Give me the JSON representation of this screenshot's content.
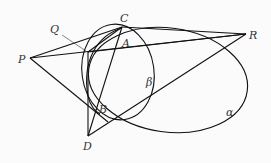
{
  "figure": {
    "type": "geometry-diagram",
    "points": [
      {
        "id": "P",
        "label": "P",
        "x": 30,
        "y": 58
      },
      {
        "id": "Q",
        "label": "Q",
        "x": 88,
        "y": 52
      },
      {
        "id": "C",
        "label": "C",
        "x": 122,
        "y": 26
      },
      {
        "id": "A",
        "label": "A",
        "x": 120,
        "y": 38
      },
      {
        "id": "R",
        "label": "R",
        "x": 246,
        "y": 34
      },
      {
        "id": "B",
        "label": "B",
        "x": 97,
        "y": 109
      },
      {
        "id": "D",
        "label": "D",
        "x": 88,
        "y": 136
      }
    ],
    "labels": {
      "P": "P",
      "Q": "Q",
      "C": "C",
      "A": "A",
      "R": "R",
      "B": "B",
      "D": "D",
      "alpha": "α",
      "beta": "β"
    },
    "curves": [
      {
        "name": "alpha",
        "label": "α",
        "kind": "ellipse"
      },
      {
        "name": "beta",
        "label": "β",
        "kind": "ellipse"
      }
    ],
    "stroke_color": "#111111",
    "label_color": "#333333"
  }
}
